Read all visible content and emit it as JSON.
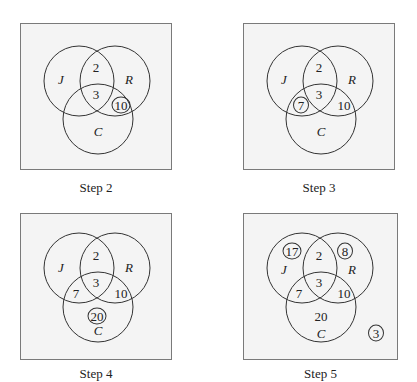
{
  "sets": {
    "J": "J",
    "R": "R",
    "C": "C"
  },
  "panels": [
    {
      "caption": "Step 2",
      "regions": {
        "JR": "2",
        "JRC": "3",
        "RC": "10"
      },
      "highlighted": [
        "RC"
      ]
    },
    {
      "caption": "Step 3",
      "regions": {
        "JR": "2",
        "JRC": "3",
        "RC": "10",
        "JC": "7"
      },
      "highlighted": [
        "JC"
      ]
    },
    {
      "caption": "Step 4",
      "regions": {
        "JR": "2",
        "JRC": "3",
        "RC": "10",
        "JC": "7",
        "C_only": "20"
      },
      "highlighted": [
        "C_only"
      ]
    },
    {
      "caption": "Step 5",
      "regions": {
        "JR": "2",
        "JRC": "3",
        "RC": "10",
        "JC": "7",
        "C_only": "20",
        "J_only": "17",
        "R_only": "8",
        "outside": "3"
      },
      "highlighted": [
        "J_only",
        "R_only",
        "outside"
      ]
    }
  ],
  "colors": {
    "box_fill": "#f4f4f4",
    "box_border": "#7a7a7a",
    "circle_stroke": "#333333"
  }
}
